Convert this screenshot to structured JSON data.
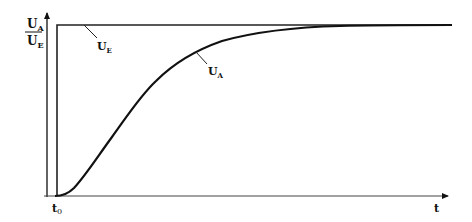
{
  "diagram": {
    "type": "step-response",
    "y_axis_label": {
      "numerator": "U",
      "numerator_sub": "A",
      "denominator": "U",
      "denominator_sub": "E"
    },
    "x_axis_label": "t",
    "t0_label": {
      "main": "t",
      "sub": "0"
    },
    "curves": [
      {
        "name": "input-step",
        "label": "U",
        "label_sub": "E"
      },
      {
        "name": "output-response",
        "label": "U",
        "label_sub": "A"
      }
    ],
    "colors": {
      "line": "#111111",
      "axis": "#333333",
      "background": "#ffffff"
    }
  }
}
